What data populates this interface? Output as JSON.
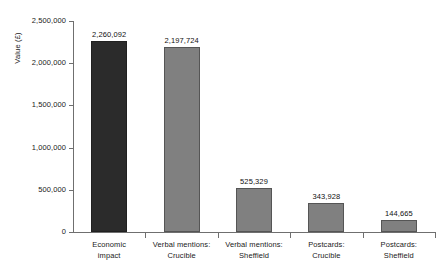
{
  "chart_data": {
    "type": "bar",
    "title": "",
    "subtitle": "",
    "xlabel": "",
    "ylabel": "Value (£)",
    "grid": false,
    "legend": "none",
    "ylim": [
      0,
      2500000
    ],
    "ytick_labels": [
      "0",
      "500,000",
      "1,000,000",
      "1,500,000",
      "2,000,000",
      "2,500,000"
    ],
    "ytick_values": [
      0,
      500000,
      1000000,
      1500000,
      2000000,
      2500000
    ],
    "categories": [
      "Economic impact",
      "Verbal mentions: Crucible",
      "Verbal mentions: Sheffield",
      "Postcards: Crucible",
      "Postcards: Sheffield"
    ],
    "category_lines": [
      [
        "Economic",
        "impact"
      ],
      [
        "Verbal mentions:",
        "Crucible"
      ],
      [
        "Verbal mentions:",
        "Sheffield"
      ],
      [
        "Postcards:",
        "Crucible"
      ],
      [
        "Postcards:",
        "Sheffield"
      ]
    ],
    "values": [
      2260092,
      2197724,
      525329,
      343928,
      144665
    ],
    "value_labels": [
      "2,260,092",
      "2,197,724",
      "525,329",
      "343,928",
      "144,665"
    ],
    "bar_colors": [
      "#2b2b2b",
      "#808080",
      "#808080",
      "#808080",
      "#808080"
    ],
    "colors": {
      "highlight_bar": "#2b2b2b",
      "standard_bar": "#808080",
      "bar_border": "#555555",
      "axis": "#6f6f6f",
      "text": "#1a1a1a",
      "background": "#ffffff"
    }
  }
}
